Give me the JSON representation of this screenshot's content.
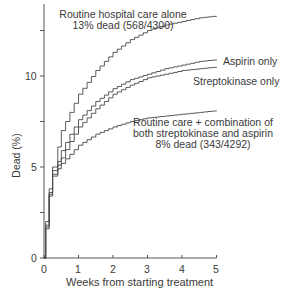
{
  "chart_data": {
    "type": "line",
    "step": true,
    "title": "",
    "xlabel": "Weeks from starting treatment",
    "ylabel": "Dead (%)",
    "xlim": [
      0,
      5
    ],
    "ylim": [
      0,
      13.5
    ],
    "xticks": [
      0,
      1,
      2,
      3,
      4,
      5
    ],
    "yticks_labeled": [
      0,
      5,
      10
    ],
    "yticks_minor": [
      2.5,
      7.5,
      12.5
    ],
    "grid": false,
    "x": [
      0,
      0.05,
      0.15,
      0.25,
      0.4,
      0.5,
      0.75,
      1.0,
      1.5,
      2.0,
      2.5,
      3.0,
      3.5,
      4.0,
      4.5,
      5.0
    ],
    "series": [
      {
        "name": "Routine hospital care alone",
        "values": [
          0,
          2.0,
          3.8,
          5.0,
          6.1,
          7.0,
          8.0,
          9.0,
          10.3,
          11.3,
          12.0,
          12.5,
          12.8,
          13.0,
          13.2,
          13.3
        ]
      },
      {
        "name": "Aspirin only",
        "values": [
          0,
          1.8,
          3.6,
          4.8,
          5.3,
          5.9,
          6.8,
          7.6,
          8.6,
          9.3,
          9.8,
          10.1,
          10.4,
          10.6,
          10.8,
          10.9
        ]
      },
      {
        "name": "Streptokinase only",
        "values": [
          0,
          1.7,
          3.5,
          4.6,
          5.1,
          5.5,
          6.4,
          7.2,
          8.2,
          9.0,
          9.5,
          9.9,
          10.1,
          10.3,
          10.4,
          10.5
        ]
      },
      {
        "name": "Routine care + combination of both streptokinase and aspirin",
        "values": [
          0,
          1.6,
          3.4,
          4.5,
          4.9,
          5.2,
          5.7,
          6.2,
          6.8,
          7.2,
          7.5,
          7.7,
          7.8,
          7.9,
          8.0,
          8.1
        ]
      }
    ],
    "annotations": [
      {
        "text": "Routine hospital care alone",
        "line2": "13% dead (568/4300)"
      },
      {
        "text": "Aspirin only"
      },
      {
        "text": "Streptokinase only"
      },
      {
        "text": "Routine care + combination of",
        "line2": "both streptokinase and aspirin",
        "line3": "8% dead (343/4292)"
      }
    ]
  },
  "labels": {
    "routine_1": "Routine hospital care alone",
    "routine_2": "13% dead (568/4300)",
    "aspirin": "Aspirin only",
    "strepto": "Streptokinase only",
    "combo_1": "Routine care + combination of",
    "combo_2": "both streptokinase and aspirin",
    "combo_3": "8% dead (343/4292)",
    "xlabel": "Weeks from starting treatment",
    "ylabel": "Dead (%)",
    "x0": "0",
    "x1": "1",
    "x2": "2",
    "x3": "3",
    "x4": "4",
    "x5": "5",
    "y0": "0",
    "y5": "5",
    "y10": "10"
  },
  "colors": {
    "line": "#4a4a4a",
    "axis": "#555555",
    "text": "#3a3a3a"
  }
}
